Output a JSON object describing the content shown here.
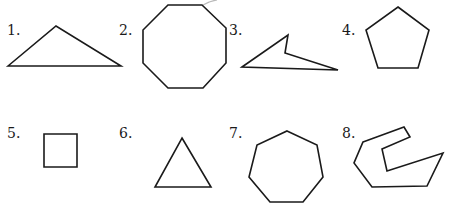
{
  "figures": [
    {
      "number": "1.",
      "shape": "obtuse triangle"
    },
    {
      "number": "2.",
      "shape": "regular octagon"
    },
    {
      "number": "3.",
      "shape": "concave quadrilateral"
    },
    {
      "number": "4.",
      "shape": "regular pentagon"
    },
    {
      "number": "5.",
      "shape": "square"
    },
    {
      "number": "6.",
      "shape": "equilateral triangle"
    },
    {
      "number": "7.",
      "shape": "regular heptagon"
    },
    {
      "number": "8.",
      "shape": "concave polygon"
    }
  ]
}
